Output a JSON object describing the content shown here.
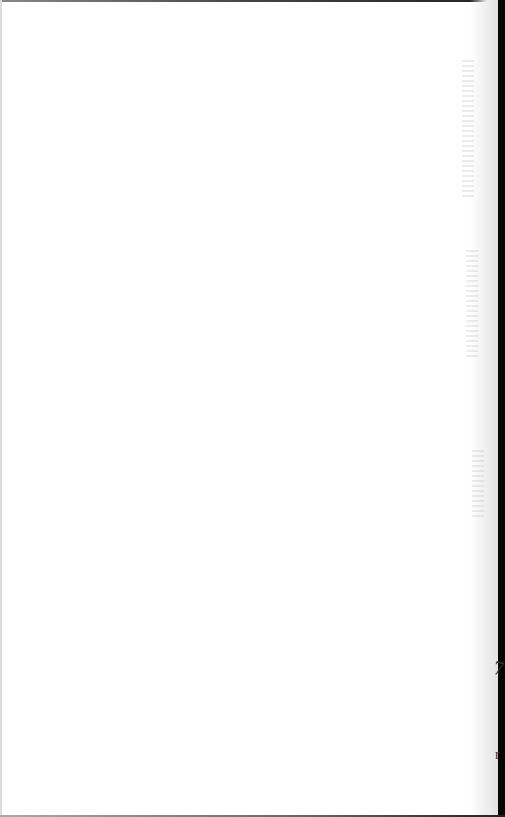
{
  "page": {
    "type": "blank scanned page",
    "text_content": "",
    "colors": {
      "paper": "#ffffff",
      "binding_edge": "#050505",
      "shadow": "#e2e2e2"
    },
    "edge_marks": [
      "7",
      "r"
    ]
  }
}
